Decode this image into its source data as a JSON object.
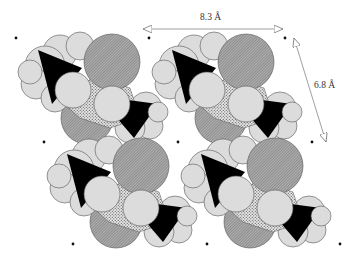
{
  "figure": {
    "type": "space-filling molecular packing diagram",
    "lattice": {
      "a_label": "8.3 Å",
      "b_label": "6.8 Å"
    },
    "molecule_count": 4,
    "lattice_point_count": 9
  },
  "colors": {
    "background": "#ffffff",
    "light_atom": "#dcdcdc",
    "hatched_atom": "#9a9a9a",
    "stipple_atom": "#b8b8b8",
    "dark_atom": "#000000",
    "outline": "#555555",
    "arrow": "#777777",
    "dot": "#111111"
  }
}
